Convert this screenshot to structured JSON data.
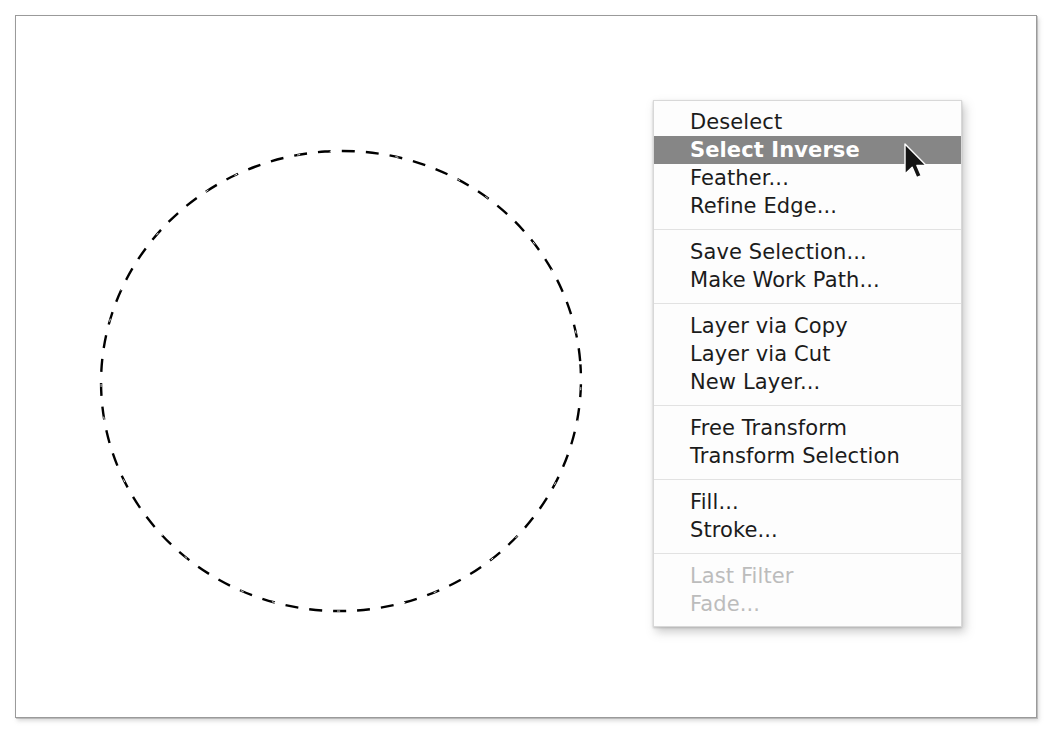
{
  "app": {
    "window_title": "",
    "canvas_background": "#ffffff",
    "frame_border_color": "#9a9a9a"
  },
  "canvas": {
    "selection": {
      "name": "elliptical-marquee-selection",
      "shape": "ellipse",
      "style": "marching-ants-dashed",
      "center_x": 340,
      "center_y": 380,
      "radius_x": 240,
      "radius_y": 230,
      "stroke_color": "#000000",
      "stroke_width": 2
    }
  },
  "context_menu": {
    "name": "selection-context-menu",
    "highlight_color": "#868686",
    "highlight_text_color": "#ffffff",
    "background_color": "#fdfdfd",
    "disabled_text_color": "#bcbcbc",
    "groups": [
      {
        "items": [
          {
            "label": "Deselect",
            "state": "enabled"
          },
          {
            "label": "Select Inverse",
            "state": "selected"
          },
          {
            "label": "Feather...",
            "state": "enabled"
          },
          {
            "label": "Refine Edge...",
            "state": "enabled"
          }
        ]
      },
      {
        "items": [
          {
            "label": "Save Selection...",
            "state": "enabled"
          },
          {
            "label": "Make Work Path...",
            "state": "enabled"
          }
        ]
      },
      {
        "items": [
          {
            "label": "Layer via Copy",
            "state": "enabled"
          },
          {
            "label": "Layer via Cut",
            "state": "enabled"
          },
          {
            "label": "New Layer...",
            "state": "enabled"
          }
        ]
      },
      {
        "items": [
          {
            "label": "Free Transform",
            "state": "enabled"
          },
          {
            "label": "Transform Selection",
            "state": "enabled"
          }
        ]
      },
      {
        "items": [
          {
            "label": "Fill...",
            "state": "enabled"
          },
          {
            "label": "Stroke...",
            "state": "enabled"
          }
        ]
      },
      {
        "items": [
          {
            "label": "Last Filter",
            "state": "disabled"
          },
          {
            "label": "Fade...",
            "state": "disabled"
          }
        ]
      }
    ]
  },
  "cursor": {
    "name": "mouse-pointer-cursor",
    "x": 903,
    "y": 143,
    "color": "#111111"
  }
}
